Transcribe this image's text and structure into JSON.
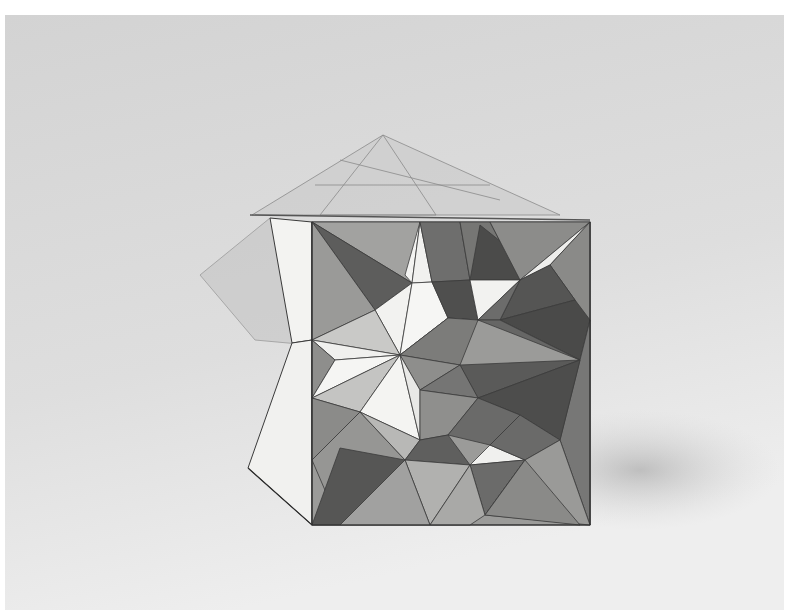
{
  "image": {
    "kind": "photograph",
    "subject": "faceted paper cube sculpture",
    "description": "Grayscale photograph of a paper/card cube whose front face is folded into star-like pyramidal facets, with translucent triangulated flaps extending from the top and left edges, on a plain light-gray backdrop.",
    "background_colors": {
      "top": "#d4d4d4",
      "bottom": "#efefef",
      "frame": "#ffffff"
    },
    "palette": {
      "white": "#f4f4f2",
      "light": "#d9d9d7",
      "mid": "#a9a9a7",
      "dark": "#727271",
      "darker": "#545453",
      "line": "#3a3a3a"
    }
  }
}
